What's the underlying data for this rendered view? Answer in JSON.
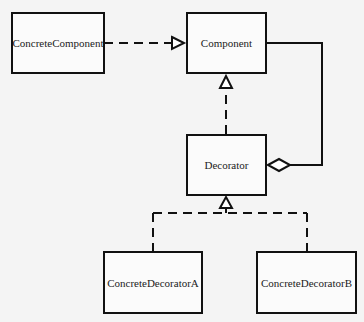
{
  "diagram": {
    "type": "UML class diagram - Decorator pattern",
    "classes": {
      "concrete_component": "ConcreteComponent",
      "component": "Component",
      "decorator": "Decorator",
      "concrete_decorator_a": "ConcreteDecoratorA",
      "concrete_decorator_b": "ConcreteDecoratorB"
    },
    "relations": [
      {
        "from": "ConcreteComponent",
        "to": "Component",
        "type": "realization"
      },
      {
        "from": "Decorator",
        "to": "Component",
        "type": "realization"
      },
      {
        "from": "Decorator",
        "to": "Component",
        "type": "aggregation"
      },
      {
        "from": "ConcreteDecoratorA",
        "to": "Decorator",
        "type": "realization"
      },
      {
        "from": "ConcreteDecoratorB",
        "to": "Decorator",
        "type": "realization"
      }
    ],
    "colors": {
      "line": "#111111",
      "background": "#f4f4f4"
    }
  }
}
